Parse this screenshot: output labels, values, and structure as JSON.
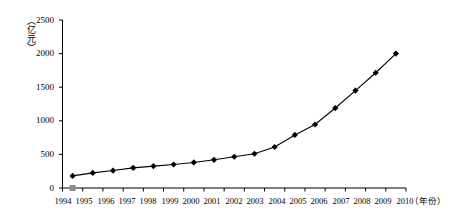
{
  "chart_data": {
    "type": "line",
    "title": "",
    "subtitle": "",
    "xlabel": "（年份）",
    "ylabel": "（亿元）",
    "categories": [
      "1994",
      "1995",
      "1996",
      "1997",
      "1998",
      "1999",
      "2000",
      "2001",
      "2002",
      "2003",
      "2004",
      "2005",
      "2006",
      "2007",
      "2008",
      "2009",
      "2010"
    ],
    "values": [
      180,
      225,
      260,
      300,
      325,
      350,
      380,
      420,
      465,
      510,
      610,
      790,
      945,
      1190,
      1450,
      1715,
      2000
    ],
    "series": [
      {
        "name": "",
        "values": [
          180,
          225,
          260,
          300,
          325,
          350,
          380,
          420,
          465,
          510,
          610,
          790,
          945,
          1190,
          1450,
          1715,
          2000
        ]
      }
    ],
    "ylim": [
      0,
      2500
    ],
    "yticks": [
      0,
      500,
      1000,
      1500,
      2000,
      2500
    ],
    "ytick_labels": [
      "0",
      "500",
      "1000",
      "1500",
      "2000",
      "2500"
    ],
    "xtick_labels": [
      "1994",
      "1995",
      "1996",
      "1997",
      "1998",
      "1999",
      "2000",
      "2001",
      "2002",
      "2003",
      "2004",
      "2005",
      "2006",
      "2007",
      "2008",
      "2009",
      "2010"
    ],
    "grid": false,
    "legend": "none",
    "marker": "diamond",
    "line_color": "#000000",
    "marker_color": "#000000",
    "origin_marker_color": "#8c8c8c",
    "axis_color": "#000000",
    "background_color": "#ffffff"
  },
  "axes": {
    "y_unit": "（亿元）",
    "x_unit": "（年份）",
    "y_labels": [
      "2500",
      "2000",
      "1500",
      "1000",
      "500",
      "0"
    ],
    "x_labels": [
      "1994",
      "1995",
      "1996",
      "1997",
      "1998",
      "1999",
      "2000",
      "2001",
      "2002",
      "2003",
      "2004",
      "2005",
      "2006",
      "2007",
      "2008",
      "2009",
      "2010"
    ]
  }
}
